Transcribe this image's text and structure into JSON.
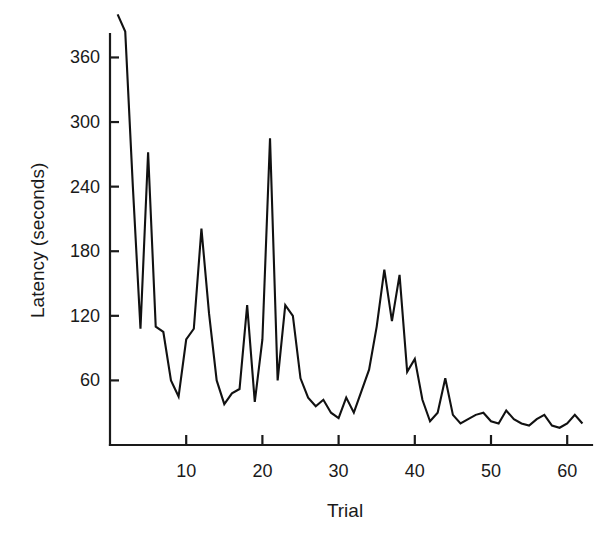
{
  "chart_data": {
    "type": "line",
    "title": "",
    "xlabel": "Trial",
    "ylabel": "Latency (seconds)",
    "xlim": [
      0,
      63
    ],
    "ylim": [
      0,
      410
    ],
    "grid": false,
    "legend": "none",
    "xticks": [
      10,
      20,
      30,
      40,
      50,
      60
    ],
    "xtick_labels": [
      "10",
      "20",
      "30",
      "40",
      "50",
      "60"
    ],
    "yticks": [
      60,
      120,
      180,
      240,
      300,
      360
    ],
    "ytick_labels": [
      "60",
      "120",
      "180",
      "240",
      "300",
      "360"
    ],
    "series": [
      {
        "name": "Latency",
        "color": "#111111",
        "x": [
          1,
          2,
          3,
          4,
          5,
          6,
          7,
          8,
          9,
          10,
          11,
          12,
          13,
          14,
          15,
          16,
          17,
          18,
          19,
          20,
          21,
          22,
          23,
          24,
          25,
          26,
          27,
          28,
          29,
          30,
          31,
          32,
          33,
          34,
          35,
          36,
          37,
          38,
          39,
          40,
          41,
          42,
          43,
          44,
          45,
          46,
          47,
          48,
          49,
          50,
          51,
          52,
          53,
          54,
          55,
          56,
          57,
          58,
          59,
          60,
          61,
          62
        ],
        "values": [
          400,
          384,
          240,
          108,
          272,
          110,
          105,
          60,
          45,
          98,
          108,
          201,
          122,
          60,
          38,
          48,
          52,
          130,
          40,
          98,
          285,
          60,
          130,
          120,
          62,
          44,
          36,
          42,
          30,
          25,
          44,
          30,
          50,
          70,
          110,
          163,
          115,
          158,
          68,
          80,
          42,
          22,
          30,
          62,
          28,
          20,
          24,
          28,
          30,
          22,
          20,
          32,
          24,
          20,
          18,
          24,
          28,
          18,
          16,
          20,
          28,
          20
        ]
      }
    ]
  },
  "axes": {
    "y_axis_label": "Latency (seconds)",
    "x_axis_label": "Trial"
  }
}
